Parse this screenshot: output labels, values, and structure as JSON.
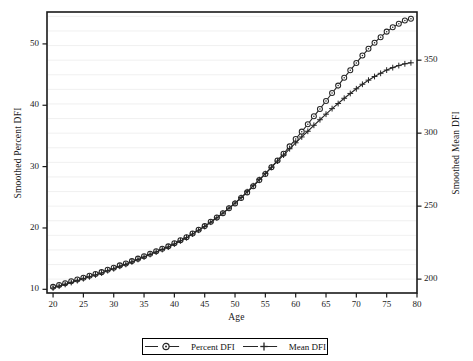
{
  "chart_data": {
    "type": "line",
    "title": "",
    "subtitle": "",
    "xlabel": "Age",
    "ylabel": "Smoothed Percent DFI",
    "y2label": "Smoothed Mean DFI",
    "xlim": [
      19,
      80
    ],
    "ylim": [
      9.4,
      55.2
    ],
    "y2lim": [
      190.5,
      383.0
    ],
    "xticks": [
      20,
      25,
      30,
      35,
      40,
      45,
      50,
      55,
      60,
      65,
      70,
      75,
      80
    ],
    "yticks": [
      10,
      20,
      30,
      40,
      50
    ],
    "y2ticks": [
      200,
      250,
      300,
      350
    ],
    "grid": "horizontal-faint",
    "legend_position": "bottom-center",
    "legend": [
      "Percent DFI",
      "Mean DFI"
    ],
    "x": [
      20,
      21,
      22,
      23,
      24,
      25,
      26,
      27,
      28,
      29,
      30,
      31,
      32,
      33,
      34,
      35,
      36,
      37,
      38,
      39,
      40,
      41,
      42,
      43,
      44,
      45,
      46,
      47,
      48,
      49,
      50,
      51,
      52,
      53,
      54,
      55,
      56,
      57,
      58,
      59,
      60,
      61,
      62,
      63,
      64,
      65,
      66,
      67,
      68,
      69,
      70,
      71,
      72,
      73,
      74,
      75,
      76,
      77,
      78,
      79
    ],
    "series": [
      {
        "name": "Percent DFI",
        "axis": "left",
        "marker": "circle",
        "values": [
          10.4,
          10.7,
          11.0,
          11.3,
          11.6,
          11.9,
          12.2,
          12.5,
          12.8,
          13.2,
          13.5,
          13.9,
          14.2,
          14.6,
          15.0,
          15.4,
          15.8,
          16.2,
          16.6,
          17.0,
          17.5,
          18.0,
          18.5,
          19.1,
          19.7,
          20.3,
          21.0,
          21.7,
          22.4,
          23.2,
          24.0,
          24.9,
          25.8,
          26.8,
          27.8,
          28.8,
          29.9,
          31.0,
          32.1,
          33.3,
          34.5,
          35.7,
          36.9,
          38.2,
          39.4,
          40.7,
          42.0,
          43.2,
          44.5,
          45.7,
          46.9,
          48.1,
          49.2,
          50.2,
          51.1,
          52.0,
          52.7,
          53.3,
          53.8,
          54.1
        ]
      },
      {
        "name": "Mean DFI",
        "axis": "right",
        "marker": "plus",
        "values": [
          193.9,
          195.2,
          196.4,
          197.7,
          199.0,
          200.3,
          201.6,
          202.9,
          204.2,
          205.8,
          207.1,
          208.8,
          210.1,
          211.8,
          213.5,
          215.2,
          216.9,
          218.6,
          220.3,
          222.0,
          224.1,
          226.2,
          228.4,
          230.9,
          233.5,
          236.1,
          239.0,
          242.0,
          245.2,
          248.6,
          252.1,
          255.9,
          259.9,
          264.0,
          268.2,
          272.3,
          276.6,
          280.9,
          285.0,
          289.3,
          293.4,
          297.4,
          301.3,
          305.4,
          309.2,
          313.0,
          316.8,
          320.3,
          323.9,
          327.2,
          330.4,
          333.5,
          336.3,
          338.8,
          341.0,
          343.2,
          344.9,
          346.3,
          347.5,
          348.2
        ]
      }
    ]
  },
  "legend": {
    "items": [
      {
        "label": "Percent DFI",
        "marker": "circle-marker"
      },
      {
        "label": "Mean DFI",
        "marker": "plus-marker"
      }
    ]
  },
  "style": {
    "frame_color": "#1a1a1a",
    "grid_color": "#ececec",
    "line_color": "#262626",
    "background": "#ffffff"
  }
}
